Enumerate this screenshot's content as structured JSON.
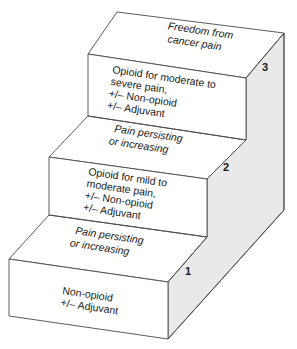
{
  "diagram": {
    "type": "staircase",
    "title": "",
    "steps": [
      {
        "number": "1",
        "tread_label": [
          "Pain persisting",
          "or increasing"
        ],
        "riser_label": [
          "Non-opioid",
          "+/– Adjuvant"
        ]
      },
      {
        "number": "2",
        "tread_label": [
          "Pain persisting",
          "or increasing"
        ],
        "riser_label": [
          "Opioid for mild to",
          "moderate pain,",
          "+/– Non-opioid",
          "+/– Adjuvant"
        ]
      },
      {
        "number": "3",
        "tread_label": [
          "Freedom from",
          "cancer pain"
        ],
        "riser_label": [
          "Opioid for moderate to",
          "severe pain,",
          "+/– Non-opioid",
          "+/– Adjuvant"
        ]
      }
    ],
    "colors": {
      "stroke": "#4a4a4a",
      "front_face": "#ffffff",
      "tread_dark": "#cfcfcf",
      "tread_light": "#f6f6f6",
      "side": "#e6e6e6"
    }
  }
}
